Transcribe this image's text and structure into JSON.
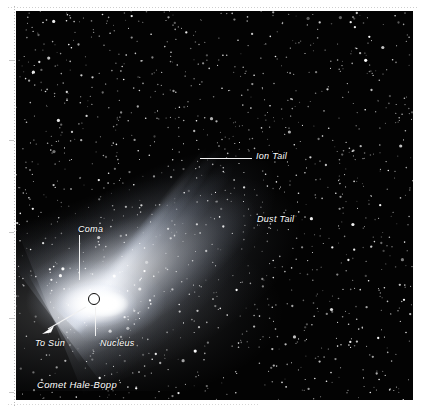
{
  "figure": {
    "subject": "Comet Hale-Bopp",
    "caption": "Comet Hale-Bopp",
    "medium": "astronomical photograph",
    "background_color": "#030303",
    "annotation_color": "#ffffff"
  },
  "annotations": {
    "ion_tail": {
      "label": "Ion Tail",
      "has_leader_line": true,
      "leader_direction": "horizontal-left"
    },
    "dust_tail": {
      "label": "Dust Tail",
      "has_leader_line": false
    },
    "coma": {
      "label": "Coma",
      "has_leader_line": true,
      "leader_direction": "vertical-down"
    },
    "nucleus": {
      "label": "Nucleus",
      "has_leader_line": true,
      "leader_direction": "vertical-up",
      "marker": "open-circle"
    },
    "to_sun": {
      "label": "To Sun",
      "has_leader_line": true,
      "leader_direction": "arrow-down-left",
      "marker": "arrowhead"
    }
  },
  "icons": {
    "nucleus_marker": "circle-outline-icon",
    "to_sun_marker": "arrow-down-left-icon"
  }
}
